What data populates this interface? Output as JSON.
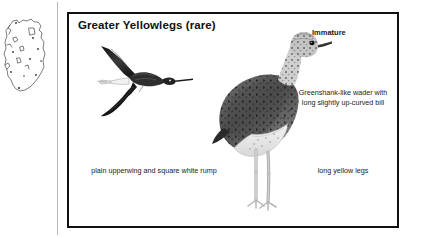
{
  "page": {
    "background_color": "#ffffff",
    "border_color": "#111111"
  },
  "map": {
    "icon": "distribution-map-outline",
    "region_name": "Ireland",
    "outline_color": "#555555",
    "record_dot_color": "#333333"
  },
  "plate": {
    "title": "Greater Yellowlegs (rare)",
    "labels": {
      "immature": "Immature"
    },
    "captions": {
      "bill": "Greenshank-like wader with long slightly up-curved bill",
      "legs": "long yellow legs",
      "rump": "plain upperwing and square white rump"
    },
    "figures": {
      "flying": "flying-wader-illustration",
      "standing": "standing-wader-illustration"
    }
  }
}
